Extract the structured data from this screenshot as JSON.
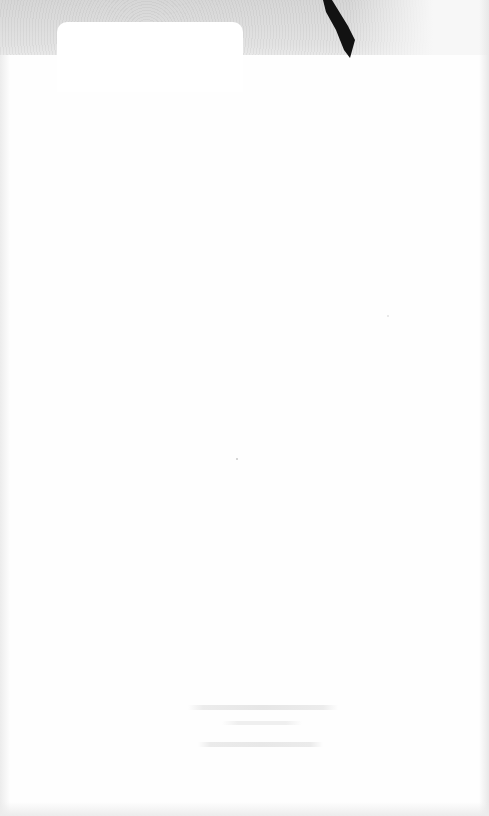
{
  "page": {
    "background_color": "#fdfdfd",
    "top_band_color": "#dcdcdc",
    "mark_color": "#111111"
  },
  "footer_text": {
    "line1": "",
    "line2": "",
    "line3": ""
  }
}
